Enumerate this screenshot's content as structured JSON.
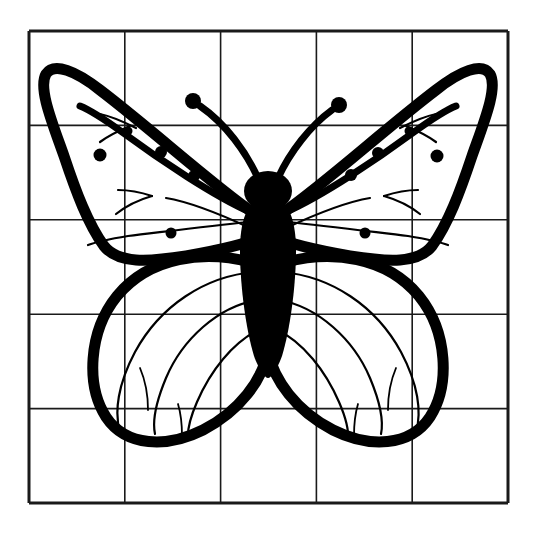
{
  "figure": {
    "style": "black ink outline drawing",
    "background_color": "#ffffff",
    "ink_color": "#000000",
    "grid_color": "#1a1a1a"
  },
  "grid": {
    "name": "drawing-grid",
    "columns": 5,
    "rows": 5,
    "left": 29,
    "top": 31,
    "right": 508,
    "bottom": 503,
    "cell_width": 95.8,
    "cell_height": 94.4,
    "x_lines": [
      29,
      124.8,
      220.6,
      316.4,
      412.2,
      508
    ],
    "y_lines": [
      31,
      125.4,
      219.8,
      314.2,
      408.6,
      503
    ],
    "border_stroke_width": 3.0,
    "inner_stroke_width": 1.6
  },
  "butterfly": {
    "center_x": 268,
    "body": {
      "name": "body-abdomen",
      "head_center": [
        268,
        192
      ],
      "head_rx": 24,
      "head_ry": 19,
      "thorax_top": 205,
      "abdomen_tip": [
        268,
        370
      ],
      "max_half_width": 27
    },
    "antennae": [
      {
        "name": "antenna-left",
        "base": [
          256,
          180
        ],
        "tip": [
          190,
          100
        ],
        "knob_r": 8
      },
      {
        "name": "antenna-right",
        "base": [
          280,
          180
        ],
        "tip": [
          338,
          104
        ],
        "knob_r": 8
      }
    ],
    "wings": [
      {
        "name": "upper-wing-left",
        "tip": [
          48,
          68
        ]
      },
      {
        "name": "upper-wing-right",
        "tip": [
          478,
          70
        ]
      },
      {
        "name": "lower-wing-left",
        "bottom": [
          127,
          442
        ]
      },
      {
        "name": "lower-wing-right",
        "bottom": [
          401,
          443
        ]
      }
    ],
    "spots": [
      {
        "name": "wing-spot",
        "cx": 100,
        "cy": 155,
        "r": 6.5,
        "wing": "upper-left"
      },
      {
        "name": "wing-spot",
        "cx": 161,
        "cy": 152,
        "r": 6.0,
        "wing": "upper-left"
      },
      {
        "name": "wing-spot",
        "cx": 194,
        "cy": 176,
        "r": 6.0,
        "wing": "upper-left"
      },
      {
        "name": "wing-spot",
        "cx": 128,
        "cy": 131,
        "r": 4.5,
        "wing": "upper-left"
      },
      {
        "name": "wing-spot",
        "cx": 171,
        "cy": 233,
        "r": 5.5,
        "wing": "upper-left"
      },
      {
        "name": "wing-spot",
        "cx": 437,
        "cy": 156,
        "r": 6.5,
        "wing": "upper-right"
      },
      {
        "name": "wing-spot",
        "cx": 378,
        "cy": 153,
        "r": 6.0,
        "wing": "upper-right"
      },
      {
        "name": "wing-spot",
        "cx": 351,
        "cy": 175,
        "r": 6.0,
        "wing": "upper-right"
      },
      {
        "name": "wing-spot",
        "cx": 409,
        "cy": 131,
        "r": 4.5,
        "wing": "upper-right"
      },
      {
        "name": "wing-spot",
        "cx": 365,
        "cy": 233,
        "r": 5.5,
        "wing": "upper-right"
      }
    ]
  }
}
